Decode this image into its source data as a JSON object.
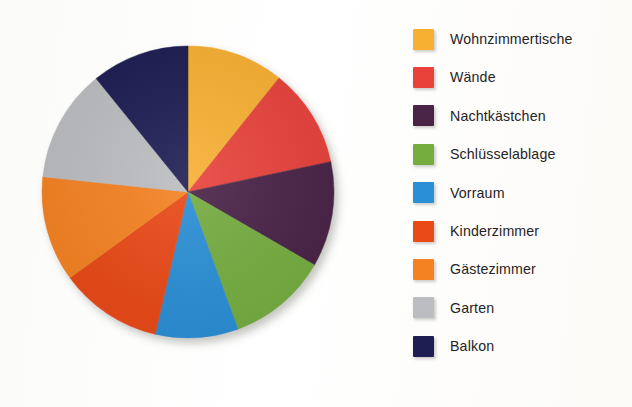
{
  "chart_data": {
    "type": "pie",
    "title": "",
    "subtitle": "",
    "legend_position": "right",
    "grid": false,
    "start_angle_deg": 0,
    "direction": "clockwise",
    "center": {
      "x": 187,
      "y": 192
    },
    "radius": 146,
    "categories": [
      "Wohnzimmertische",
      "Wände",
      "Nachtkästchen",
      "Schlüsselablage",
      "Vorraum",
      "Kinderzimmer",
      "Gästezimmer",
      "Garten",
      "Balkon"
    ],
    "values": [
      10.7,
      11.0,
      11.7,
      11.1,
      9.2,
      11.4,
      11.7,
      12.5,
      10.8
    ],
    "angles_deg": [
      38.6,
      39.4,
      42.0,
      40.0,
      33.0,
      41.0,
      42.0,
      45.0,
      39.0
    ],
    "colors": [
      "#f8b033",
      "#e8423a",
      "#4a2447",
      "#75ad3f",
      "#2b8fd6",
      "#ea4a16",
      "#f58220",
      "#bcbdc0",
      "#1f1e52"
    ],
    "slices": [
      {
        "label": "Wohnzimmertische",
        "value": 10.7,
        "angle_deg": 38.6,
        "start_deg": 0.0,
        "end_deg": 38.6,
        "color": "#f8b033"
      },
      {
        "label": "Wände",
        "value": 11.0,
        "angle_deg": 39.4,
        "start_deg": 38.6,
        "end_deg": 78.0,
        "color": "#e8423a"
      },
      {
        "label": "Nachtkästchen",
        "value": 11.7,
        "angle_deg": 42.0,
        "start_deg": 78.0,
        "end_deg": 120.0,
        "color": "#4a2447"
      },
      {
        "label": "Schlüsselablage",
        "value": 11.1,
        "angle_deg": 40.0,
        "start_deg": 120.0,
        "end_deg": 160.0,
        "color": "#75ad3f"
      },
      {
        "label": "Vorraum",
        "value": 9.2,
        "angle_deg": 33.0,
        "start_deg": 160.0,
        "end_deg": 193.0,
        "color": "#2b8fd6"
      },
      {
        "label": "Kinderzimmer",
        "value": 11.4,
        "angle_deg": 41.0,
        "start_deg": 193.0,
        "end_deg": 234.0,
        "color": "#ea4a16"
      },
      {
        "label": "Gästezimmer",
        "value": 11.7,
        "angle_deg": 42.0,
        "start_deg": 234.0,
        "end_deg": 276.0,
        "color": "#f58220"
      },
      {
        "label": "Garten",
        "value": 12.5,
        "angle_deg": 45.0,
        "start_deg": 276.0,
        "end_deg": 321.0,
        "color": "#bcbdc0"
      },
      {
        "label": "Balkon",
        "value": 10.8,
        "angle_deg": 39.0,
        "start_deg": 321.0,
        "end_deg": 360.0,
        "color": "#1f1e52"
      }
    ],
    "xlabel": "",
    "ylabel": ""
  },
  "legend": {
    "items": [
      {
        "label": "Wohnzimmertische",
        "color": "#f8b033"
      },
      {
        "label": "Wände",
        "color": "#e8423a"
      },
      {
        "label": "Nachtkästchen",
        "color": "#4a2447"
      },
      {
        "label": "Schlüsselablage",
        "color": "#75ad3f"
      },
      {
        "label": "Vorraum",
        "color": "#2b8fd6"
      },
      {
        "label": "Kinderzimmer",
        "color": "#ea4a16"
      },
      {
        "label": "Gästezimmer",
        "color": "#f58220"
      },
      {
        "label": "Garten",
        "color": "#bcbdc0"
      },
      {
        "label": "Balkon",
        "color": "#1f1e52"
      }
    ]
  }
}
